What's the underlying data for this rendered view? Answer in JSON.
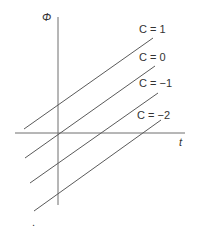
{
  "diagram": {
    "axes": {
      "y_label": "Φ",
      "x_label": "t"
    },
    "lines": [
      {
        "label": "C = 1",
        "x1": 24,
        "y1": 129,
        "x2": 153,
        "y2": 38,
        "lx": 139,
        "ly": 33
      },
      {
        "label": "C = 0",
        "x1": 25,
        "y1": 158,
        "x2": 155,
        "y2": 66,
        "lx": 139,
        "ly": 61
      },
      {
        "label": "C = −1",
        "x1": 30,
        "y1": 183,
        "x2": 158,
        "y2": 93,
        "lx": 139,
        "ly": 87
      },
      {
        "label": "C = −2",
        "x1": 34,
        "y1": 211,
        "x2": 161,
        "y2": 120,
        "lx": 137,
        "ly": 119
      }
    ],
    "footer_mark": "."
  }
}
